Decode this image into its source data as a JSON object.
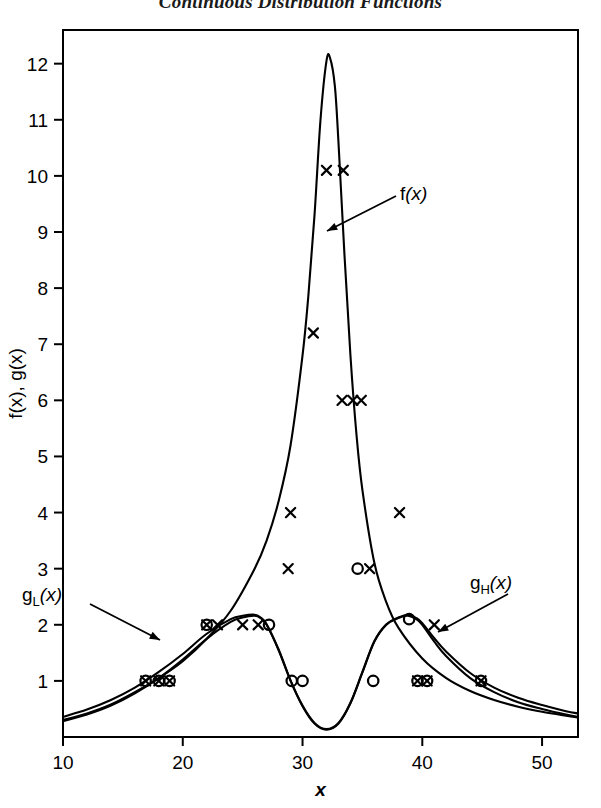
{
  "title": "Continuous Distribution Functions",
  "axes": {
    "xlabel": "x",
    "ylabel": "f(x), g(x)",
    "x_ticks": [
      "10",
      "20",
      "30",
      "40",
      "50"
    ],
    "y_ticks": [
      "1",
      "2",
      "3",
      "4",
      "5",
      "6",
      "7",
      "8",
      "9",
      "10",
      "11",
      "12"
    ]
  },
  "annotations": {
    "f": {
      "label": "f(x)",
      "base": "f",
      "sub": "",
      "arg": "(x)"
    },
    "gL": {
      "label": "gL(x)",
      "base": "g",
      "sub": "L",
      "arg": "(x)"
    },
    "gH": {
      "label": "gH(x)",
      "base": "g",
      "sub": "H",
      "arg": "(x)"
    }
  },
  "colors": {
    "ink": "#000000",
    "background": "#ffffff"
  },
  "chart_data": {
    "type": "line",
    "title": "Continuous Distribution Functions",
    "xlabel": "x",
    "ylabel": "f(x), g(x)",
    "xlim": [
      10,
      53
    ],
    "ylim": [
      0,
      12.6
    ],
    "grid": false,
    "legend": "none (inline arrow annotations)",
    "series": [
      {
        "name": "f(x)",
        "type": "line",
        "comment": "sharply peaked unimodal curve, apex about 12.1 near x=32",
        "x": [
          10,
          12,
          14,
          16,
          18,
          20,
          22,
          24,
          26,
          27,
          28,
          29,
          30,
          30.5,
          31,
          31.5,
          32,
          32.3,
          32.7,
          33,
          33.5,
          34,
          34.5,
          35,
          36,
          37,
          38,
          40,
          42,
          44,
          46,
          48,
          50,
          52,
          53
        ],
        "y": [
          0.3,
          0.42,
          0.58,
          0.8,
          1.05,
          1.35,
          1.75,
          2.25,
          3.0,
          3.5,
          4.2,
          5.2,
          6.8,
          7.9,
          9.3,
          11.0,
          12.05,
          12.1,
          11.6,
          10.6,
          8.6,
          6.8,
          5.4,
          4.4,
          3.1,
          2.4,
          1.95,
          1.4,
          1.05,
          0.82,
          0.66,
          0.54,
          0.45,
          0.38,
          0.35
        ]
      },
      {
        "name": "gL(x)",
        "type": "line",
        "comment": "bimodal lower curve; left hump about 2.15 near x=26, dip about 0.15 near x=32, right hump about 2.15 near x=39",
        "x": [
          10,
          12,
          14,
          16,
          18,
          20,
          22,
          24,
          25,
          26,
          26.5,
          27,
          28,
          29,
          30,
          31,
          32,
          33,
          34,
          35,
          36,
          37,
          38,
          38.8,
          39.5,
          40,
          41,
          42,
          44,
          46,
          48,
          50,
          52,
          53
        ],
        "y": [
          0.28,
          0.4,
          0.56,
          0.78,
          1.05,
          1.38,
          1.75,
          2.05,
          2.13,
          2.16,
          2.12,
          2.0,
          1.55,
          1.0,
          0.55,
          0.24,
          0.13,
          0.24,
          0.6,
          1.15,
          1.7,
          2.0,
          2.12,
          2.16,
          2.1,
          2.0,
          1.7,
          1.44,
          1.05,
          0.8,
          0.62,
          0.5,
          0.4,
          0.36
        ]
      },
      {
        "name": "gH(x)",
        "type": "line",
        "comment": "second bimodal curve nearly coincident with gL(x), slightly offset on the flanks",
        "x": [
          10,
          12,
          14,
          16,
          18,
          20,
          22,
          24,
          25,
          26,
          26.5,
          27,
          28,
          29,
          30,
          31,
          32,
          33,
          34,
          35,
          36,
          37,
          38,
          38.8,
          39.5,
          40,
          41,
          42,
          44,
          46,
          48,
          50,
          52,
          53
        ],
        "y": [
          0.36,
          0.49,
          0.66,
          0.88,
          1.16,
          1.48,
          1.84,
          2.1,
          2.16,
          2.18,
          2.13,
          2.01,
          1.56,
          1.01,
          0.56,
          0.25,
          0.14,
          0.25,
          0.61,
          1.16,
          1.71,
          2.01,
          2.13,
          2.18,
          2.12,
          2.03,
          1.76,
          1.52,
          1.14,
          0.88,
          0.7,
          0.57,
          0.46,
          0.42
        ]
      }
    ],
    "markers": [
      {
        "symbol": "x",
        "x": 22.9,
        "y": 2.0
      },
      {
        "symbol": "x",
        "x": 25.0,
        "y": 2.0
      },
      {
        "symbol": "x",
        "x": 26.3,
        "y": 2.0
      },
      {
        "symbol": "x",
        "x": 28.8,
        "y": 3.0
      },
      {
        "symbol": "x",
        "x": 29.0,
        "y": 4.0
      },
      {
        "symbol": "x",
        "x": 30.9,
        "y": 7.2
      },
      {
        "symbol": "x",
        "x": 32.0,
        "y": 10.1
      },
      {
        "symbol": "x",
        "x": 33.4,
        "y": 10.1
      },
      {
        "symbol": "x",
        "x": 33.3,
        "y": 6.0
      },
      {
        "symbol": "x",
        "x": 34.2,
        "y": 6.0
      },
      {
        "symbol": "x",
        "x": 34.9,
        "y": 6.0
      },
      {
        "symbol": "x",
        "x": 35.6,
        "y": 3.0
      },
      {
        "symbol": "x",
        "x": 38.1,
        "y": 4.0
      },
      {
        "symbol": "x",
        "x": 41.0,
        "y": 2.0
      },
      {
        "symbol": "o",
        "x": 27.2,
        "y": 2.0
      },
      {
        "symbol": "o",
        "x": 29.1,
        "y": 1.0
      },
      {
        "symbol": "o",
        "x": 30.0,
        "y": 1.0
      },
      {
        "symbol": "o",
        "x": 34.6,
        "y": 3.0
      },
      {
        "symbol": "o",
        "x": 35.9,
        "y": 1.0
      },
      {
        "symbol": "o",
        "x": 38.9,
        "y": 2.1
      },
      {
        "symbol": "xo",
        "x": 16.9,
        "y": 1.0
      },
      {
        "symbol": "xo",
        "x": 18.0,
        "y": 1.0
      },
      {
        "symbol": "xo",
        "x": 18.9,
        "y": 1.0
      },
      {
        "symbol": "xo",
        "x": 22.0,
        "y": 2.0
      },
      {
        "symbol": "xo",
        "x": 39.6,
        "y": 1.0
      },
      {
        "symbol": "xo",
        "x": 40.4,
        "y": 1.0
      },
      {
        "symbol": "xo",
        "x": 44.9,
        "y": 1.0
      }
    ]
  }
}
